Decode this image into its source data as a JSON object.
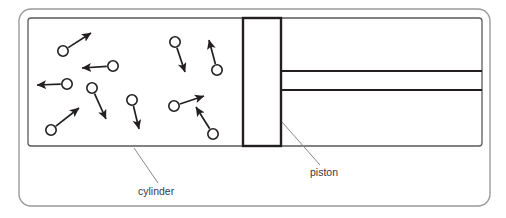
{
  "figure": {
    "domain": "diagram",
    "width": 506,
    "height": 218,
    "background_color": "#ffffff",
    "line_color": "#231f20",
    "frame_color": "#8a8a8a",
    "leader_color": "#8a8a8a",
    "text_color": "#3a3a3a"
  },
  "outer_frame": {
    "name": "outer-rounded-frame",
    "x": 19,
    "y": 9,
    "width": 471,
    "height": 197,
    "rx": 12,
    "stroke": "#9a9a9a",
    "stroke_width": 1.4
  },
  "cylinder": {
    "name": "cylinder-body",
    "label": "cylinder",
    "x": 28,
    "y": 18,
    "width": 454,
    "height": 128,
    "rx": 3,
    "stroke": "#5a5a5a",
    "stroke_width": 1.3
  },
  "piston": {
    "name": "piston-head",
    "label": "piston",
    "x": 243,
    "y": 18,
    "width": 38,
    "height": 128,
    "stroke": "#231f20",
    "stroke_width": 2.4,
    "fill": "#ffffff"
  },
  "piston_rod": {
    "name": "piston-rod",
    "top_line_y": 71,
    "bottom_line_y": 90,
    "x_start": 280,
    "x_end": 482,
    "stroke": "#231f20",
    "stroke_width": 2.0
  },
  "labels": [
    {
      "id": "cylinder-label",
      "text": "cylinder",
      "text_x": 138,
      "text_y": 195,
      "anchor": "start",
      "leader": {
        "x1": 134,
        "y1": 148,
        "x2": 158,
        "y2": 183
      }
    },
    {
      "id": "piston-label",
      "text": "piston",
      "text_x": 310,
      "text_y": 176,
      "anchor": "start",
      "leader": {
        "x1": 282,
        "y1": 122,
        "x2": 320,
        "y2": 165
      }
    }
  ],
  "molecules": {
    "name": "gas-molecules",
    "circle_radius": 5.2,
    "circle_stroke": "#231f20",
    "circle_stroke_width": 1.6,
    "circle_fill": "#ffffff",
    "arrow_stroke": "#231f20",
    "arrow_stroke_width": 1.7,
    "count": 11,
    "items": [
      {
        "id": "molecule-1",
        "cx": 63,
        "cy": 51,
        "vx_tip_x": 91,
        "vx_tip_y": 33
      },
      {
        "id": "molecule-2",
        "cx": 113,
        "cy": 66,
        "vx_tip_x": 82,
        "vx_tip_y": 68
      },
      {
        "id": "molecule-3",
        "cx": 67,
        "cy": 84,
        "vx_tip_x": 37,
        "vx_tip_y": 85
      },
      {
        "id": "molecule-4",
        "cx": 92,
        "cy": 88,
        "vx_tip_x": 106,
        "vx_tip_y": 119
      },
      {
        "id": "molecule-5",
        "cx": 132,
        "cy": 100,
        "vx_tip_x": 139,
        "vx_tip_y": 129
      },
      {
        "id": "molecule-6",
        "cx": 51,
        "cy": 130,
        "vx_tip_x": 79,
        "vx_tip_y": 108
      },
      {
        "id": "molecule-7",
        "cx": 175,
        "cy": 42,
        "vx_tip_x": 185,
        "vx_tip_y": 72
      },
      {
        "id": "molecule-8",
        "cx": 217,
        "cy": 70,
        "vx_tip_x": 209,
        "vx_tip_y": 40
      },
      {
        "id": "molecule-9",
        "cx": 174,
        "cy": 106,
        "vx_tip_x": 204,
        "vx_tip_y": 96
      },
      {
        "id": "molecule-10",
        "cx": 213,
        "cy": 134,
        "vx_tip_x": 196,
        "vx_tip_y": 107
      },
      {
        "id": "molecule-11",
        "cx": 132,
        "cy": 100,
        "vx_tip_x": 139,
        "vx_tip_y": 129
      }
    ]
  }
}
